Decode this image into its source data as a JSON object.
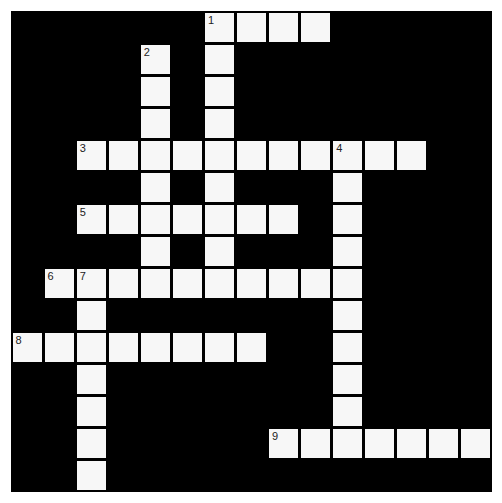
{
  "puzzle": {
    "rows": 15,
    "cols": 15,
    "cell_size": 32.07,
    "colors": {
      "background": "#ffffff",
      "block": "#000000",
      "cell": "#f7f7f7",
      "number": "#222222"
    },
    "entries": [
      {
        "number": "1",
        "direction": "across",
        "row": 0,
        "col": 6,
        "length": 4
      },
      {
        "number": "1",
        "direction": "down",
        "row": 0,
        "col": 6,
        "length": 9
      },
      {
        "number": "2",
        "direction": "down",
        "row": 1,
        "col": 4,
        "length": 8
      },
      {
        "number": "3",
        "direction": "across",
        "row": 4,
        "col": 2,
        "length": 11
      },
      {
        "number": "4",
        "direction": "down",
        "row": 4,
        "col": 10,
        "length": 10
      },
      {
        "number": "5",
        "direction": "across",
        "row": 6,
        "col": 2,
        "length": 7
      },
      {
        "number": "6",
        "direction": "across",
        "row": 8,
        "col": 1,
        "length": 10
      },
      {
        "number": "7",
        "direction": "down",
        "row": 8,
        "col": 2,
        "length": 7
      },
      {
        "number": "8",
        "direction": "across",
        "row": 10,
        "col": 0,
        "length": 8
      },
      {
        "number": "9",
        "direction": "across",
        "row": 13,
        "col": 8,
        "length": 7
      }
    ],
    "numbered_cells": [
      {
        "number": "1",
        "row": 0,
        "col": 6
      },
      {
        "number": "2",
        "row": 1,
        "col": 4
      },
      {
        "number": "3",
        "row": 4,
        "col": 2
      },
      {
        "number": "4",
        "row": 4,
        "col": 10
      },
      {
        "number": "5",
        "row": 6,
        "col": 2
      },
      {
        "number": "6",
        "row": 8,
        "col": 1
      },
      {
        "number": "7",
        "row": 8,
        "col": 2
      },
      {
        "number": "8",
        "row": 10,
        "col": 0
      },
      {
        "number": "9",
        "row": 13,
        "col": 8
      }
    ]
  }
}
